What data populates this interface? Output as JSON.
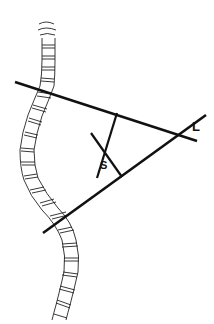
{
  "figure": {
    "labels": {
      "L": "L",
      "S": "S"
    },
    "colors": {
      "line": "#111111",
      "spine_outline": "#222222",
      "background": "#ffffff"
    },
    "lines": {
      "upper_endplate": {
        "x1": 15,
        "y1": 82,
        "x2": 197,
        "y2": 141
      },
      "lower_endplate": {
        "x1": 43,
        "y1": 233,
        "x2": 206,
        "y2": 115
      },
      "perpendicular_upper": {
        "x1": 117,
        "y1": 113,
        "x2": 97,
        "y2": 178
      },
      "perpendicular_lower": {
        "x1": 91,
        "y1": 133,
        "x2": 122,
        "y2": 177
      }
    }
  }
}
